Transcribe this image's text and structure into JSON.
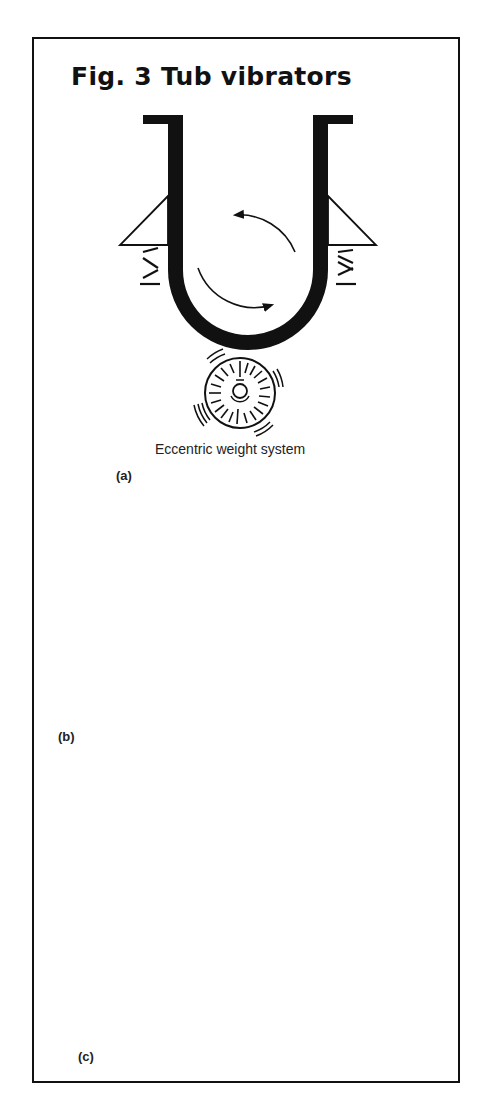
{
  "figure": {
    "title": "Fig. 3  Tub vibrators",
    "panels": [
      {
        "id": "a",
        "label": "(a)",
        "caption": "Eccentric weight system",
        "description": "U-shaped tub on triangular brackets supported by springs, single eccentric weight motor below, circulating arrows inside"
      },
      {
        "id": "b",
        "label": "(b)",
        "caption": "",
        "description": "Round-bottom tub with two eccentric weight motors on upper sides, angled springs below, dashed V flow line and circulating arrows"
      },
      {
        "id": "c",
        "label": "(c)",
        "caption": "",
        "description": "Asymmetric J-shaped tub with bulged right side, two eccentric weight motors at lower corners, springs beneath, curved flow arrow"
      }
    ]
  },
  "colors": {
    "ink": "#111111",
    "background": "#ffffff"
  }
}
